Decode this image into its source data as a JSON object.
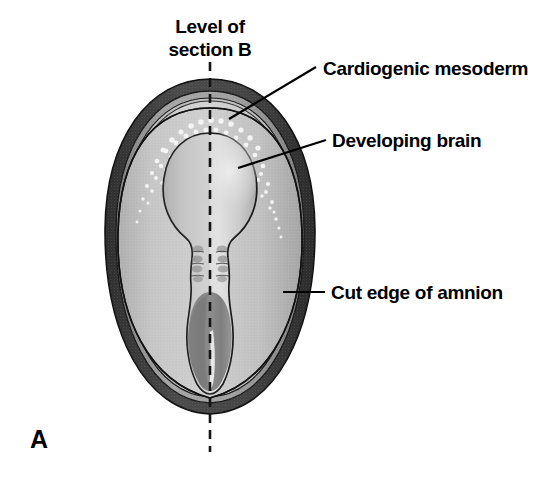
{
  "figure": {
    "panel_letter": "A",
    "section_line_title_1": "Level of",
    "section_line_title_2": "section B",
    "background_color": "#ffffff"
  },
  "labels": [
    {
      "id": "cardiogenic-mesoderm",
      "text": "Cardiogenic mesoderm",
      "text_x": 323,
      "text_y": 75,
      "leader": {
        "x1": 316,
        "y1": 67,
        "x2": 229,
        "y2": 119
      }
    },
    {
      "id": "developing-brain",
      "text": "Developing brain",
      "text_x": 332,
      "text_y": 147,
      "leader": {
        "x1": 326,
        "y1": 140,
        "x2": 238,
        "y2": 168
      }
    },
    {
      "id": "cut-edge-of-amnion",
      "text": "Cut edge of amnion",
      "text_x": 331,
      "text_y": 299,
      "leader": {
        "x1": 325,
        "y1": 292,
        "x2": 283,
        "y2": 292
      }
    }
  ],
  "midline": {
    "label": "plane-of-section-B",
    "x": 210,
    "y_top": 62,
    "y_bottom": 452
  },
  "structures": [
    {
      "id": "amnion-cut-edge-ring",
      "name": "Cut edge of amnion",
      "color": "#3f3f3f"
    },
    {
      "id": "amnion-inner-band",
      "name": "Amnion inner band",
      "color": "#9a9a9a"
    },
    {
      "id": "extraembryonic-field",
      "name": "Extraembryonic field",
      "color": "#c9c9c9"
    },
    {
      "id": "embryonic-disc",
      "name": "Embryonic disc",
      "color": "#bdbdbd"
    },
    {
      "id": "cardiogenic-mesoderm-stipple",
      "name": "Cardiogenic mesoderm",
      "color": "#f2f2f2"
    },
    {
      "id": "developing-brain",
      "name": "Developing brain",
      "color": "#d5d5d5"
    },
    {
      "id": "somites",
      "name": "Somites",
      "color": "#a0a0a0"
    },
    {
      "id": "primitive-streak-region",
      "name": "Primitive streak region",
      "color": "#8d8d8d"
    }
  ],
  "colors": {
    "outer_dark_ring": "#3f3f3f",
    "mid_gray_band": "#9a9a9a",
    "body_light": "#c9c9c9",
    "brain_fill": "#d8d8d8",
    "streak_dark": "#8a8a8a",
    "stipple_white": "#f5f5f5",
    "ink": "#000000"
  }
}
